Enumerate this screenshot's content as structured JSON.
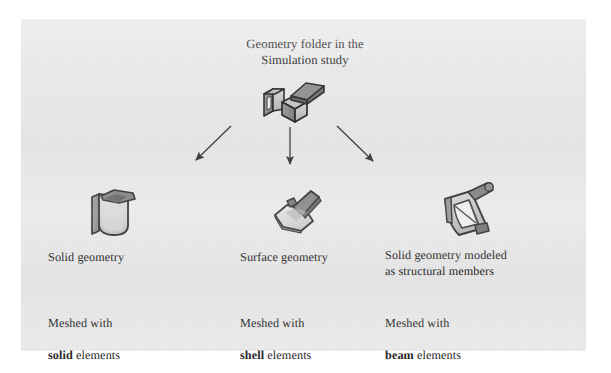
{
  "figure": {
    "title": "Geometry folder in the\nSimulation study",
    "background_color": "#e9e9e9",
    "page_color": "#ffffff",
    "ink_color": "#262626"
  },
  "root": {
    "icon": "solid-body-folder-icon",
    "label": "Geometry folder in the\nSimulation study"
  },
  "branches": [
    {
      "id": "solid",
      "icon": "solid-geometry-icon",
      "geometry_label": "Solid geometry",
      "mesh_prefix": "Meshed with",
      "mesh_element_bold": "solid",
      "mesh_element_suffix": " elements",
      "arrow": "arrow-down-left"
    },
    {
      "id": "surface",
      "icon": "surface-geometry-icon",
      "geometry_label": "Surface geometry",
      "mesh_prefix": "Meshed with",
      "mesh_element_bold": "shell",
      "mesh_element_suffix": " elements",
      "arrow": "arrow-down"
    },
    {
      "id": "beam",
      "icon": "structural-member-icon",
      "geometry_label": "Solid geometry modeled\nas structural members",
      "mesh_prefix": "Meshed with",
      "mesh_element_bold": "beam",
      "mesh_element_suffix": " elements",
      "arrow": "arrow-down-right"
    }
  ]
}
